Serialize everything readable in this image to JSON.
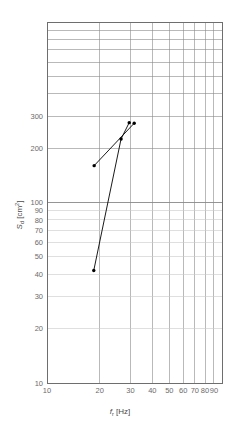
{
  "chart_data": {
    "type": "line",
    "title": "",
    "xlabel": "fr [Hz]",
    "ylabel": "Sd [cm2]",
    "xscale": "log",
    "yscale": "log",
    "xlim": [
      10,
      100
    ],
    "ylim": [
      10,
      1000
    ],
    "grid": true,
    "legend": "none",
    "x_tick_labels": [
      "10",
      "20",
      "30",
      "40",
      "50",
      "60",
      "70",
      "80",
      "90"
    ],
    "x_tick_values": [
      10,
      20,
      30,
      40,
      50,
      60,
      70,
      80,
      90
    ],
    "y_tick_labels": [
      "10",
      "20",
      "30",
      "40",
      "50",
      "60",
      "70",
      "80",
      "90",
      "100",
      "200",
      "300"
    ],
    "y_tick_values": [
      10,
      20,
      30,
      40,
      50,
      60,
      70,
      80,
      90,
      100,
      200,
      300
    ],
    "series": [
      {
        "name": "upper-segment",
        "marker": "dot",
        "color": "#000000",
        "points": [
          {
            "x": 18.6,
            "y": 160
          },
          {
            "x": 31.5,
            "y": 275
          }
        ]
      },
      {
        "name": "steep-segment",
        "marker": "dot",
        "color": "#000000",
        "points": [
          {
            "x": 18.5,
            "y": 42
          },
          {
            "x": 26.5,
            "y": 225
          },
          {
            "x": 29.5,
            "y": 277
          }
        ]
      }
    ],
    "marker_points": [
      {
        "x": 18.6,
        "y": 160
      },
      {
        "x": 18.5,
        "y": 42
      },
      {
        "x": 26.5,
        "y": 225
      },
      {
        "x": 29.5,
        "y": 277
      },
      {
        "x": 31.5,
        "y": 275
      }
    ]
  },
  "axis": {
    "x_title_symbol": "f",
    "x_title_sub": "r",
    "x_title_unit": "[Hz]",
    "y_title_symbol": "S",
    "y_title_sub": "d",
    "y_title_unit": "[cm",
    "y_title_sup": "2",
    "y_title_close": "]"
  },
  "colors": {
    "grid_major": "#8a8a8a",
    "grid_minor": "#c9c9c9",
    "frame": "#6e6e6e",
    "data": "#000000",
    "label": "#6b6b6b",
    "background": "#ffffff"
  }
}
